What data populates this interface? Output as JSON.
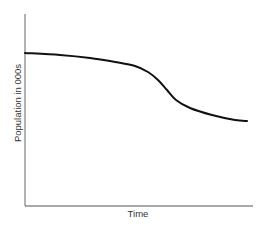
{
  "chart_data": {
    "type": "line",
    "title": "",
    "xlabel": "Time",
    "ylabel": "Population in 000s",
    "grid": false,
    "legend": null,
    "x_ticks": [],
    "y_ticks": [],
    "series": [
      {
        "name": "Population",
        "color": "#111111",
        "x": [
          0,
          0.15,
          0.28,
          0.39,
          0.47,
          0.53,
          0.57,
          0.62,
          0.68,
          0.76,
          0.86,
          0.97
        ],
        "values": [
          0.8,
          0.79,
          0.77,
          0.75,
          0.71,
          0.66,
          0.61,
          0.54,
          0.5,
          0.46,
          0.44,
          0.43
        ]
      }
    ],
    "xlim": [
      0,
      1
    ],
    "ylim": [
      0,
      1
    ],
    "annotations": []
  },
  "layout": {
    "axis_color": "#555555",
    "origin": [
      25,
      206
    ],
    "x_end": 253,
    "y_top": 14,
    "curve_points": [
      [
        25,
        53
      ],
      [
        60,
        55
      ],
      [
        90,
        58
      ],
      [
        115,
        62
      ],
      [
        135,
        66
      ],
      [
        148,
        72
      ],
      [
        158,
        80
      ],
      [
        167,
        90
      ],
      [
        176,
        100
      ],
      [
        190,
        108
      ],
      [
        212,
        115
      ],
      [
        235,
        120
      ],
      [
        247,
        121
      ]
    ]
  }
}
